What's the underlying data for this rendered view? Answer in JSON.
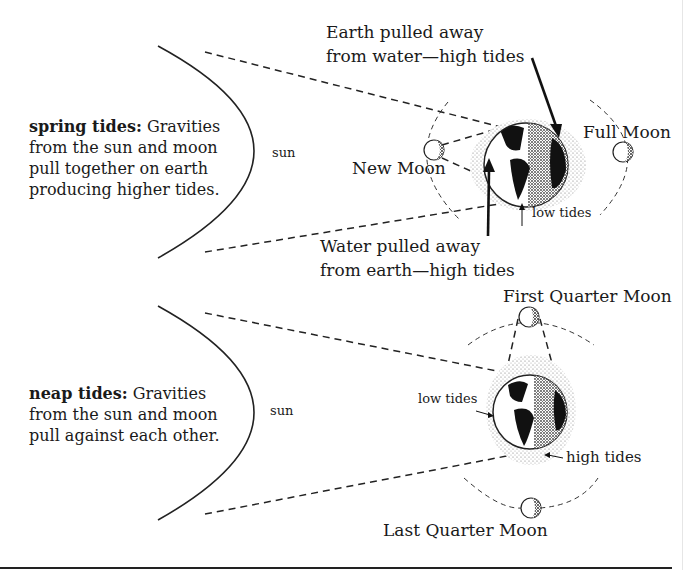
{
  "header": {
    "cut_off_title": "Tides"
  },
  "spring": {
    "description_term": "spring tides:",
    "description_lines": [
      "Gravities",
      "from the sun and moon",
      "pull together on earth",
      "producing higher tides."
    ],
    "sun_label": "sun",
    "new_moon_label": "New Moon",
    "full_moon_label": "Full Moon",
    "earth_label_line1": "Earth pulled away",
    "earth_label_line2": "from water—high tides",
    "water_label_line1": "Water pulled away",
    "water_label_line2": "from earth—high tides",
    "low_tides_label": "low tides"
  },
  "neap": {
    "description_term": "neap tides:",
    "description_lines": [
      "Gravities",
      "from the sun and moon",
      "pull against each other."
    ],
    "sun_label": "sun",
    "first_quarter_label": "First Quarter Moon",
    "last_quarter_label": "Last Quarter Moon",
    "low_tides_label": "low tides",
    "high_tides_label": "high tides"
  },
  "colors": {
    "ink": "#1a1a1a",
    "stipple": "#9a9a9a",
    "background": "#ffffff"
  }
}
